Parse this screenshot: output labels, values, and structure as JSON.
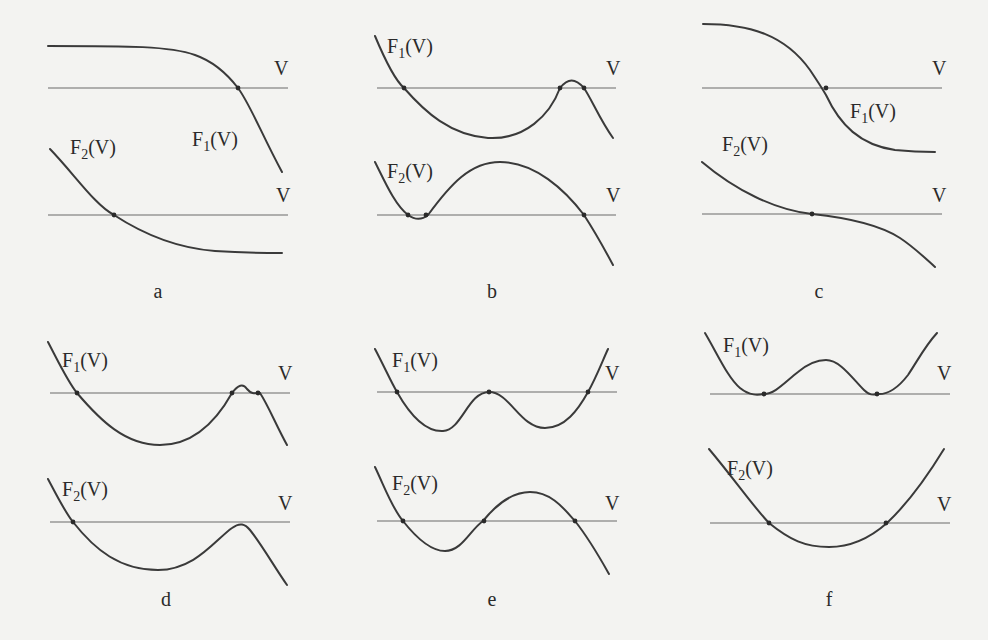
{
  "figure": {
    "colors": {
      "background": "#f3f3f1",
      "curve": "#3a3a3a",
      "line": "#6a6a6a",
      "text": "#2a2a2a"
    },
    "panels": [
      {
        "id": "a",
        "caption": "a",
        "top": {
          "label_main": "F",
          "label_sub": "1",
          "label_arg": "(V)",
          "line_label": "V",
          "intersections": 1
        },
        "bottom": {
          "label_main": "F",
          "label_sub": "2",
          "label_arg": "(V)",
          "line_label": "V",
          "intersections": 1
        }
      },
      {
        "id": "b",
        "caption": "b",
        "top": {
          "label_main": "F",
          "label_sub": "1",
          "label_arg": "(V)",
          "line_label": "V",
          "intersections": 3
        },
        "bottom": {
          "label_main": "F",
          "label_sub": "2",
          "label_arg": "(V)",
          "line_label": "V",
          "intersections": 3
        }
      },
      {
        "id": "c",
        "caption": "c",
        "top": {
          "label_main": "F",
          "label_sub": "1",
          "label_arg": "(V)",
          "line_label": "V",
          "intersections": 1
        },
        "bottom": {
          "label_main": "F",
          "label_sub": "2",
          "label_arg": "(V)",
          "line_label": "V",
          "intersections": 1
        }
      },
      {
        "id": "d",
        "caption": "d",
        "top": {
          "label_main": "F",
          "label_sub": "1",
          "label_arg": "(V)",
          "line_label": "V",
          "intersections": 3
        },
        "bottom": {
          "label_main": "F",
          "label_sub": "2",
          "label_arg": "(V)",
          "line_label": "V",
          "intersections": 1
        }
      },
      {
        "id": "e",
        "caption": "e",
        "top": {
          "label_main": "F",
          "label_sub": "1",
          "label_arg": "(V)",
          "line_label": "V",
          "intersections": 3
        },
        "bottom": {
          "label_main": "F",
          "label_sub": "2",
          "label_arg": "(V)",
          "line_label": "V",
          "intersections": 3
        }
      },
      {
        "id": "f",
        "caption": "f",
        "top": {
          "label_main": "F",
          "label_sub": "1",
          "label_arg": "(V)",
          "line_label": "V",
          "intersections": 2
        },
        "bottom": {
          "label_main": "F",
          "label_sub": "2",
          "label_arg": "(V)",
          "line_label": "V",
          "intersections": 2
        }
      }
    ]
  }
}
